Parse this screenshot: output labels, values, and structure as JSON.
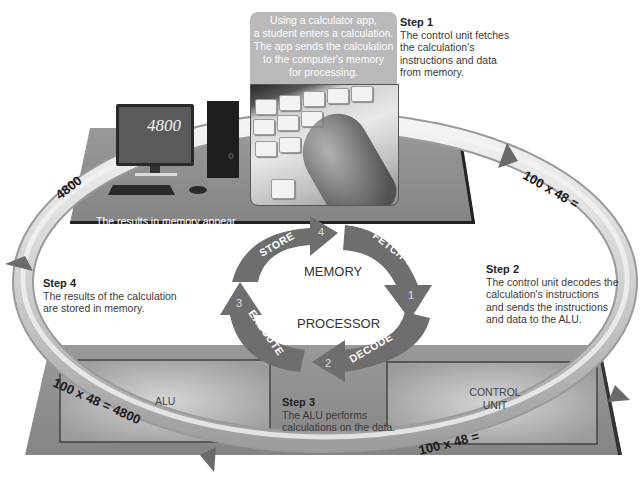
{
  "callout": {
    "text_lines": [
      "Using a calculator app,",
      "a student enters a calculation.",
      "The app sends the calculation",
      "to the computer's memory",
      "for processing."
    ]
  },
  "steps": [
    {
      "title": "Step 1",
      "lines": [
        "The control unit fetches",
        "the calculation's",
        "instructions and data",
        "from memory."
      ]
    },
    {
      "title": "Step 2",
      "lines": [
        "The control unit decodes the",
        "calculation's instructions",
        "and sends the instructions",
        "and data to the ALU."
      ]
    },
    {
      "title": "Step 3",
      "lines": [
        "The ALU performs",
        "calculations on the data."
      ]
    },
    {
      "title": "Step 4",
      "lines": [
        "The results of the calculation",
        "are stored in memory."
      ]
    }
  ],
  "monitor": {
    "display_value": "4800",
    "caption_lines": [
      "The results in memory appear",
      "on the screen of the monitor."
    ]
  },
  "cycle": {
    "center_top": "MEMORY",
    "center_bottom": "PROCESSOR",
    "stages": [
      {
        "label": "FETCH",
        "number": "1"
      },
      {
        "label": "DECODE",
        "number": "2"
      },
      {
        "label": "EXECUTE",
        "number": "3"
      },
      {
        "label": "STORE",
        "number": "4"
      }
    ]
  },
  "ring_labels": {
    "top_right": "100 x 48 =",
    "bottom_right": "100 x 48 =",
    "bottom_left": "100 x 48 = 4800",
    "top_left": "4800"
  },
  "components": {
    "alu": "ALU",
    "control_unit_lines": [
      "CONTROL",
      "UNIT"
    ]
  },
  "colors": {
    "platform": "#8e8e8e",
    "platform_dark": "#5a5a5a",
    "cycle_arrow": "#6e6e6e",
    "ring": "#d8d8d8",
    "callout_bg": "#b9b9b9"
  }
}
